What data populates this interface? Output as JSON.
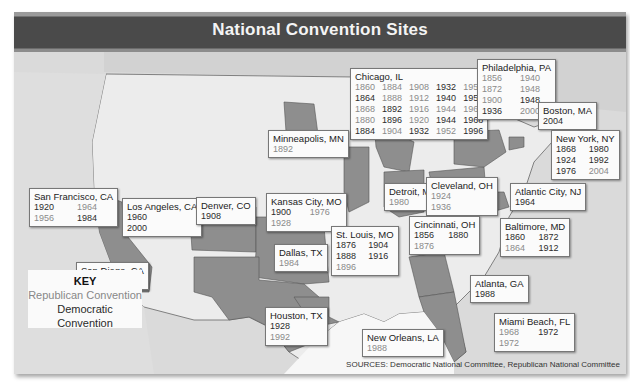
{
  "title": "National Convention Sites",
  "key": {
    "title": "KEY",
    "republican": "Republican Convention",
    "democratic": "Democratic Convention"
  },
  "source": "SOURCES: Democratic National Committee, Republican National Committee",
  "colors": {
    "title_bar": "#4a4a4a",
    "republican_text": "#8a8a8a",
    "democratic_text": "#2b2b2b",
    "host_state": "#8e8e8e",
    "other_state": "#e8e8e8",
    "water": "#d8d8d8"
  },
  "cities": [
    {
      "name": "Chicago, IL",
      "years": [
        "1860",
        "1884",
        "1908",
        "1932",
        "1952",
        "1864",
        "1888",
        "1912",
        "1940",
        "1956",
        "1868",
        "1892",
        "1916",
        "1944",
        "1960",
        "1880",
        "1896",
        "1920",
        "1944",
        "1968",
        "1884",
        "1904",
        "1932",
        "1952",
        "1996"
      ],
      "parties": [
        "R",
        "R",
        "R",
        "D",
        "R",
        "D",
        "R",
        "R",
        "D",
        "D",
        "R",
        "D",
        "R",
        "R",
        "R",
        "R",
        "D",
        "R",
        "D",
        "D",
        "D",
        "R",
        "D",
        "R",
        "D"
      ]
    },
    {
      "name": "Philadelphia, PA",
      "years": [
        "1856",
        "1940",
        "1872",
        "1948",
        "1900",
        "1948",
        "1936",
        "2000"
      ],
      "parties": [
        "R",
        "R",
        "R",
        "R",
        "R",
        "D",
        "D",
        "R"
      ]
    },
    {
      "name": "Boston, MA",
      "years": [
        "2004"
      ],
      "parties": [
        "D"
      ]
    },
    {
      "name": "New York, NY",
      "years": [
        "1868",
        "1980",
        "1924",
        "1992",
        "1976",
        "2004"
      ],
      "parties": [
        "D",
        "D",
        "D",
        "D",
        "D",
        "R"
      ]
    },
    {
      "name": "Atlantic City, NJ",
      "years": [
        "1964"
      ],
      "parties": [
        "D"
      ]
    },
    {
      "name": "Baltimore, MD",
      "years": [
        "1860",
        "1872",
        "1864",
        "1912"
      ],
      "parties": [
        "D",
        "D",
        "R",
        "D"
      ]
    },
    {
      "name": "Minneapolis, MN",
      "years": [
        "1892"
      ],
      "parties": [
        "R"
      ]
    },
    {
      "name": "Detroit, MI",
      "years": [
        "1980"
      ],
      "parties": [
        "R"
      ]
    },
    {
      "name": "Cleveland, OH",
      "years": [
        "1924",
        "1936"
      ],
      "parties": [
        "R",
        "R"
      ]
    },
    {
      "name": "Cincinnati, OH",
      "years": [
        "1856",
        "1880",
        "1876"
      ],
      "parties": [
        "D",
        "D",
        "R"
      ]
    },
    {
      "name": "San Francisco, CA",
      "years": [
        "1920",
        "1964",
        "1956",
        "1984"
      ],
      "parties": [
        "D",
        "R",
        "R",
        "D"
      ]
    },
    {
      "name": "Los Angeles, CA",
      "years": [
        "1960",
        "2000"
      ],
      "parties": [
        "D",
        "D"
      ]
    },
    {
      "name": "Denver, CO",
      "years": [
        "1908"
      ],
      "parties": [
        "D"
      ]
    },
    {
      "name": "Kansas City, MO",
      "years": [
        "1900",
        "1976",
        "1928"
      ],
      "parties": [
        "D",
        "R",
        "R"
      ]
    },
    {
      "name": "St. Louis, MO",
      "years": [
        "1876",
        "1904",
        "1888",
        "1916",
        "1896"
      ],
      "parties": [
        "D",
        "D",
        "D",
        "D",
        "R"
      ]
    },
    {
      "name": "Dallas, TX",
      "years": [
        "1984"
      ],
      "parties": [
        "R"
      ]
    },
    {
      "name": "San Diego, CA",
      "years": [
        "1996"
      ],
      "parties": [
        "R"
      ]
    },
    {
      "name": "Houston, TX",
      "years": [
        "1928",
        "1992"
      ],
      "parties": [
        "D",
        "R"
      ]
    },
    {
      "name": "New Orleans, LA",
      "years": [
        "1988"
      ],
      "parties": [
        "R"
      ]
    },
    {
      "name": "Atlanta, GA",
      "years": [
        "1988"
      ],
      "parties": [
        "D"
      ]
    },
    {
      "name": "Miami Beach, FL",
      "years": [
        "1968",
        "1972",
        "1972"
      ],
      "parties": [
        "R",
        "D",
        "R"
      ]
    }
  ]
}
